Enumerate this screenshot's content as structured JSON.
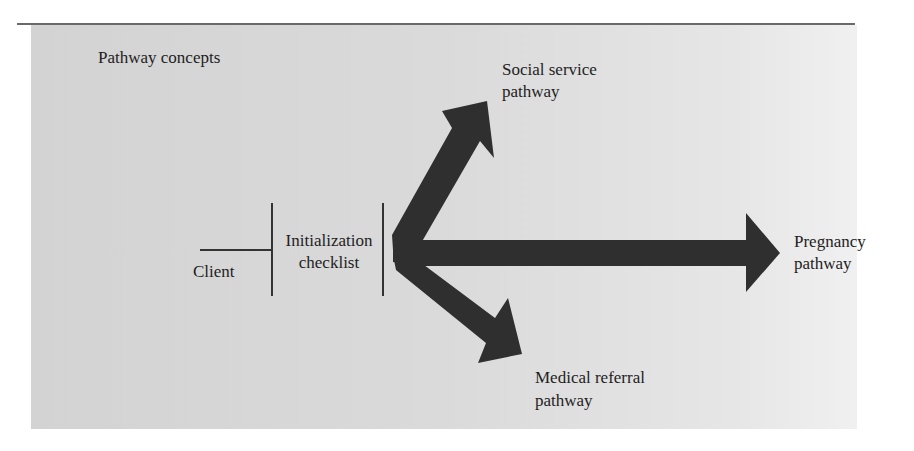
{
  "figure": {
    "title": "Pathway concepts",
    "nodes": {
      "client": "Client",
      "checklist_line1": "Initialization",
      "checklist_line2": "checklist"
    },
    "pathways": {
      "social_line1": "Social service",
      "social_line2": "pathway",
      "pregnancy_line1": "Pregnancy",
      "pregnancy_line2": "pathway",
      "medical_line1": "Medical referral",
      "medical_line2": "pathway"
    },
    "colors": {
      "arrow": "#2f2f2f",
      "panel": "#d6d6d6",
      "line": "#333333"
    }
  }
}
